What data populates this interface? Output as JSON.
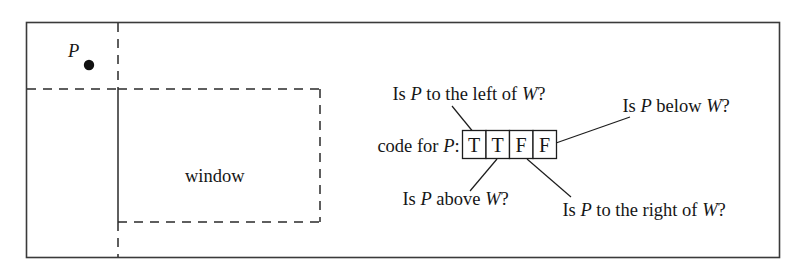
{
  "figure": {
    "diagram_type": "annotated-geometry-diagram",
    "colors": {
      "background": "#ffffff",
      "frame_stroke": "#3a3a3a",
      "line_stroke": "#2a2a2a",
      "text": "#161616",
      "point_fill": "#111111"
    }
  },
  "scene": {
    "point_label": "P",
    "window_label": "window"
  },
  "code_row": {
    "prefix_plain": "code for ",
    "prefix_italic": "P",
    "prefix_colon": ":",
    "cells": [
      {
        "value": "T",
        "index": 0
      },
      {
        "value": "T",
        "index": 1
      },
      {
        "value": "F",
        "index": 2
      },
      {
        "value": "F",
        "index": 3
      }
    ]
  },
  "annotations": [
    {
      "id": "left-of",
      "parts": [
        "Is ",
        "P",
        " to the left of ",
        "W",
        "?"
      ],
      "full": "Is P to the left of W?",
      "target_cell": 0,
      "position": "top-left"
    },
    {
      "id": "below",
      "parts": [
        "Is ",
        "P",
        " below ",
        "W",
        "?"
      ],
      "full": "Is P below W?",
      "target_cell": 3,
      "position": "top-right"
    },
    {
      "id": "above",
      "parts": [
        "Is ",
        "P",
        " above ",
        "W",
        "?"
      ],
      "full": "Is P above W?",
      "target_cell": 1,
      "position": "bottom-left"
    },
    {
      "id": "right-of",
      "parts": [
        "Is ",
        "P",
        " to the right of ",
        "W",
        "?"
      ],
      "full": "Is P to the right of W?",
      "target_cell": 2,
      "position": "bottom-right"
    }
  ],
  "text_runs": {
    "left_of": {
      "a": "Is ",
      "b": "P",
      "c": " to the left of ",
      "d": "W",
      "e": "?"
    },
    "below": {
      "a": "Is ",
      "b": "P",
      "c": " below ",
      "d": "W",
      "e": "?"
    },
    "above": {
      "a": "Is ",
      "b": "P",
      "c": " above ",
      "d": "W",
      "e": "?"
    },
    "right_of": {
      "a": "Is ",
      "b": "P",
      "c": " to the right of ",
      "d": "W",
      "e": "?"
    }
  }
}
